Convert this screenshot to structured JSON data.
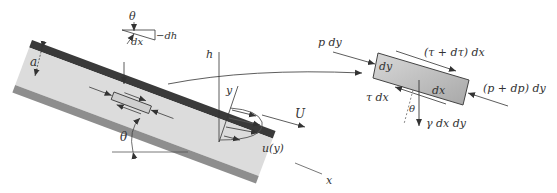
{
  "colors": {
    "wall_dark": "#3a3a3a",
    "wall_light": "#8e8e8e",
    "fluid": "#dcdcdc",
    "element_fill": "#b8b8b8",
    "ink": "#333333"
  },
  "inset": {
    "theta": "θ",
    "dx": "dx",
    "dh": "−dh"
  },
  "channel": {
    "gap_label": "a",
    "angle_label": "θ"
  },
  "profile": {
    "h_axis": "h",
    "y_axis": "y",
    "x_axis": "x",
    "velocity": "U",
    "velocity_profile": "u(y)"
  },
  "element": {
    "left_force": "p dy",
    "right_force": "(p + dp) dy",
    "top_shear": "(τ + dτ) dx",
    "bottom_shear": "τ dx",
    "side_label": "dy",
    "length_label": "dx",
    "angle_label": "θ",
    "weight": "γ dx dy"
  }
}
